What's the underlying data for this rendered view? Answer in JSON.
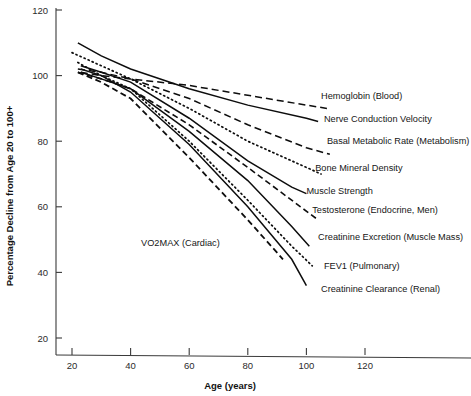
{
  "chart_data": {
    "type": "line",
    "title": "",
    "subtitle": "",
    "xlabel": "Age (years)",
    "ylabel": "Percentage Decline from Age 20 to 100+",
    "xlim": [
      14,
      145
    ],
    "ylim": [
      14,
      124
    ],
    "xticks": [
      20,
      40,
      60,
      80,
      100,
      120
    ],
    "yticks": [
      20,
      40,
      60,
      80,
      100,
      120
    ],
    "xtick_labels": [
      "20",
      "40",
      "60",
      "80",
      "100",
      "120"
    ],
    "ytick_labels": [
      "20",
      "40",
      "60",
      "80",
      "100",
      "120"
    ],
    "grid": false,
    "legend_position": "inline-right-of-line-ends",
    "series": [
      {
        "name": "Hemoglobin (Blood)",
        "label": "Hemoglobin (Blood)",
        "dash": "dashed",
        "stroke_width": 1.5,
        "dasharray": "7,4",
        "label_x": 105,
        "label_y": 93,
        "x": [
          23,
          30,
          40,
          60,
          80,
          100,
          107
        ],
        "y": [
          101,
          100,
          99,
          97,
          94,
          91,
          90
        ]
      },
      {
        "name": "Nerve Conduction Velocity",
        "label": "Nerve Conduction Velocity",
        "dash": "solid",
        "stroke_width": 1.5,
        "dasharray": "",
        "label_x": 106,
        "label_y": 86,
        "x": [
          22,
          30,
          40,
          60,
          80,
          100,
          104
        ],
        "y": [
          110,
          106,
          102,
          96,
          91,
          87,
          86
        ]
      },
      {
        "name": "Basal Metabolic Rate (Metabolism)",
        "label": "Basal Metabolic Rate (Metabolism)",
        "dash": "dashed",
        "stroke_width": 1.5,
        "dasharray": "7,4",
        "label_x": 107,
        "label_y": 79,
        "x": [
          22,
          30,
          40,
          60,
          80,
          100,
          108
        ],
        "y": [
          102,
          101,
          99,
          93,
          85,
          78,
          76
        ]
      },
      {
        "name": "Bone Mineral Density",
        "label": "Bone Mineral Density",
        "dash": "dotted",
        "stroke_width": 1.7,
        "dasharray": "1.2,3.2",
        "label_x": 103,
        "label_y": 71,
        "x": [
          20,
          30,
          40,
          60,
          80,
          100,
          105
        ],
        "y": [
          107,
          103,
          99,
          90,
          80,
          72,
          70
        ]
      },
      {
        "name": "Muscle Strength",
        "label": "Muscle Strength",
        "dash": "solid",
        "stroke_width": 1.5,
        "dasharray": "",
        "label_x": 100,
        "label_y": 64,
        "x": [
          23,
          30,
          40,
          60,
          80,
          95,
          100
        ],
        "y": [
          103,
          101,
          98,
          87,
          74,
          66,
          64
        ]
      },
      {
        "name": "Testosterone (Endocrine, Men)",
        "label": "Testosterone (Endocrine, Men)",
        "dash": "dashed",
        "stroke_width": 1.6,
        "dasharray": "6,3.5",
        "label_x": 102,
        "label_y": 58,
        "x": [
          22,
          30,
          40,
          60,
          80,
          98,
          104
        ],
        "y": [
          101,
          99,
          96,
          85,
          72,
          60,
          56
        ]
      },
      {
        "name": "Creatinine Excretion (Muscle Mass)",
        "label": "Creatinine Excretion (Muscle Mass)",
        "dash": "solid",
        "stroke_width": 1.5,
        "dasharray": "",
        "label_x": 104,
        "label_y": 50,
        "x": [
          23,
          30,
          40,
          60,
          80,
          95,
          101
        ],
        "y": [
          101,
          99,
          96,
          83,
          68,
          54,
          48
        ]
      },
      {
        "name": "FEV1 (Pulmonary)",
        "label": "FEV1 (Pulmonary)",
        "dash": "dotted",
        "stroke_width": 1.7,
        "dasharray": "1.2,3.2",
        "label_x": 106,
        "label_y": 41,
        "x": [
          22,
          30,
          40,
          60,
          80,
          95,
          102
        ],
        "y": [
          104,
          100,
          96,
          80,
          62,
          48,
          42
        ]
      },
      {
        "name": "Creatinine Clearance (Renal)",
        "label": "Creatinine Clearance (Renal)",
        "dash": "solid",
        "stroke_width": 1.5,
        "dasharray": "",
        "label_x": 105,
        "label_y": 34,
        "x": [
          23,
          30,
          40,
          60,
          80,
          95,
          100
        ],
        "y": [
          102,
          100,
          95,
          79,
          60,
          44,
          36
        ]
      },
      {
        "name": "VO2MAX (Cardiac)",
        "label": "VO2MAX (Cardiac)",
        "dash": "dashed",
        "stroke_width": 1.8,
        "dasharray": "6,3.5",
        "label_x": 57,
        "label_y": 48,
        "x": [
          22,
          30,
          40,
          60,
          80,
          92
        ],
        "y": [
          101,
          98,
          93,
          75,
          56,
          44
        ]
      }
    ]
  },
  "axis": {
    "x_title": "Age (years)",
    "y_title": "Percentage Decline from Age 20 to 100+"
  }
}
